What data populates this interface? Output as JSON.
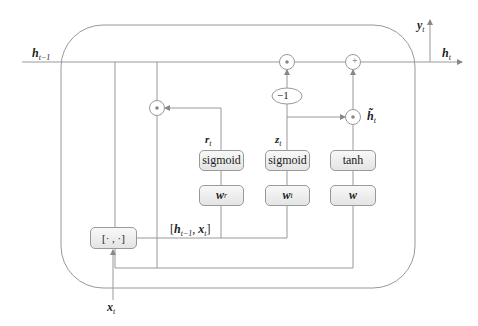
{
  "diagram": {
    "inputs": {
      "h_prev": "h",
      "h_prev_sub": "t−1",
      "x": "x",
      "x_sub": "t"
    },
    "outputs": {
      "h": "h",
      "h_sub": "t",
      "y": "y",
      "y_sub": "t"
    },
    "gates": {
      "reset": {
        "label": "r",
        "sub": "t",
        "activation": "sigmoid",
        "weight": "w",
        "weight_sub": "r"
      },
      "update": {
        "label": "z",
        "sub": "t",
        "activation": "sigmoid",
        "weight": "w",
        "weight_sub": "t"
      },
      "candidate": {
        "label": "h̃",
        "sub": "t",
        "activation": "tanh",
        "weight": "w",
        "weight_sub": ""
      }
    },
    "concat": {
      "box_label": "[· ,  ·]",
      "annotation_open": "[",
      "annotation_h": "h",
      "annotation_h_sub": "t−1",
      "annotation_sep": ",  ",
      "annotation_x": "x",
      "annotation_x_sub": "t",
      "annotation_close": "]"
    },
    "ops": {
      "mul": "•",
      "add": "+",
      "neg_one": "−1"
    }
  }
}
